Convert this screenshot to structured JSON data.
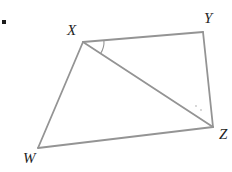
{
  "page": {
    "background": "#ffffff"
  },
  "bullet": {
    "x": 2,
    "y": 20,
    "size": 4,
    "color": "#1c1c1c"
  },
  "diagram": {
    "stroke_color": "#949494",
    "stroke_width": 1.8,
    "label_color": "#1f1f1f",
    "vertices": [
      {
        "label": "X",
        "x": 83,
        "y": 42,
        "label_x": 67,
        "label_y": 23
      },
      {
        "label": "Y",
        "x": 203,
        "y": 32,
        "label_x": 204,
        "label_y": 11
      },
      {
        "label": "Z",
        "x": 213,
        "y": 127,
        "label_x": 219,
        "label_y": 127
      },
      {
        "label": "W",
        "x": 38,
        "y": 148,
        "label_x": 23,
        "label_y": 151
      }
    ],
    "edges": [
      [
        "W",
        "X"
      ],
      [
        "X",
        "Y"
      ],
      [
        "Y",
        "Z"
      ],
      [
        "Z",
        "W"
      ]
    ],
    "diagonal": [
      "X",
      "Z"
    ],
    "angle_mark": {
      "vertex": "X",
      "from": "Y",
      "to": "Z",
      "radius": 21,
      "stroke_width": 1.1
    },
    "faint_dots": [
      {
        "x": 196,
        "y": 106
      },
      {
        "x": 201,
        "y": 110
      }
    ],
    "faint_dot_color": "#c6c6c6"
  }
}
